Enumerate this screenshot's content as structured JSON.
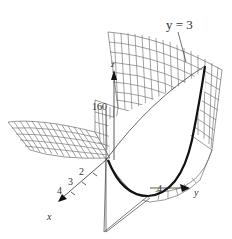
{
  "figure": {
    "type": "3d-surface-wireframe",
    "annotation": "y = 3",
    "z_axis": {
      "label": "z",
      "tick_label": "160"
    },
    "x_axis": {
      "label": "x",
      "ticks": [
        "2",
        "3",
        "4"
      ]
    },
    "y_axis": {
      "label": "y",
      "ticks": [
        "4"
      ]
    },
    "colors": {
      "mesh": "#555555",
      "trace": "#111111",
      "background": "#ffffff"
    }
  }
}
